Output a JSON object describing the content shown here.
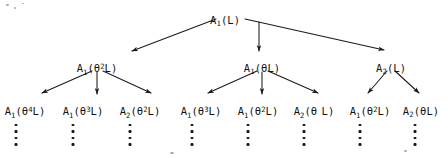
{
  "diagram": {
    "type": "tree",
    "title": "",
    "symbol_theta": "θ",
    "ink_color": "#121212",
    "background_color": "#ffffff",
    "levels": 3,
    "root": {
      "id": "root",
      "label": "A₁(L)",
      "base": "A",
      "subscript": "1",
      "open": "(",
      "operator": "",
      "exponent": "",
      "argument": "L",
      "close": ")",
      "x": 225,
      "y": 14
    },
    "level2": [
      {
        "id": "n2-1",
        "label": "A₁(θ²L)",
        "base": "A",
        "subscript": "1",
        "open": "(",
        "operator": "θ",
        "exponent": "2",
        "argument": "L",
        "close": ")",
        "x": 97,
        "y": 62
      },
      {
        "id": "n2-2",
        "label": "A₁(θL)",
        "base": "A",
        "subscript": "1",
        "open": "(",
        "operator": "θ",
        "exponent": "",
        "argument": "L",
        "close": ")",
        "x": 262,
        "y": 62
      },
      {
        "id": "n2-3",
        "label": "A₂(L)",
        "base": "A",
        "subscript": "2",
        "open": "(",
        "operator": "",
        "exponent": "",
        "argument": "L",
        "close": ")",
        "x": 391,
        "y": 62
      }
    ],
    "level3": [
      {
        "id": "n3-1",
        "label": "A₁(θ⁴L)",
        "base": "A",
        "subscript": "1",
        "open": "(",
        "operator": "θ",
        "exponent": "4",
        "argument": "L",
        "close": ")",
        "x": 25,
        "y": 105,
        "parent": "n2-1"
      },
      {
        "id": "n3-2",
        "label": "A₁(θ³L)",
        "base": "A",
        "subscript": "1",
        "open": "(",
        "operator": "θ",
        "exponent": "3",
        "argument": "L",
        "close": ")",
        "x": 83,
        "y": 105,
        "parent": "n2-1"
      },
      {
        "id": "n3-3",
        "label": "A₂(θ²L)",
        "base": "A",
        "subscript": "2",
        "open": "(",
        "operator": "θ",
        "exponent": "2",
        "argument": "L",
        "close": ")",
        "x": 140,
        "y": 105,
        "parent": "n2-1"
      },
      {
        "id": "n3-4",
        "label": "A₁(θ³L)",
        "base": "A",
        "subscript": "1",
        "open": "(",
        "operator": "θ",
        "exponent": "3",
        "argument": "L",
        "close": ")",
        "x": 201,
        "y": 105,
        "parent": "n2-2"
      },
      {
        "id": "n3-5",
        "label": "A₁(θ²L)",
        "base": "A",
        "subscript": "1",
        "open": "(",
        "operator": "θ",
        "exponent": "2",
        "argument": "L",
        "close": ")",
        "x": 258,
        "y": 105,
        "parent": "n2-2"
      },
      {
        "id": "n3-6",
        "label": "A₂(θ L)",
        "base": "A",
        "subscript": "2",
        "open": "(",
        "operator": "θ",
        "exponent": " ",
        "argument": "L",
        "close": ")",
        "x": 314,
        "y": 105,
        "parent": "n2-2"
      },
      {
        "id": "n3-7",
        "label": "A₁(θ²L)",
        "base": "A",
        "subscript": "1",
        "open": "(",
        "operator": "θ",
        "exponent": "2",
        "argument": "L",
        "close": ")",
        "x": 370,
        "y": 105,
        "parent": "n2-3"
      },
      {
        "id": "n3-8",
        "label": "A₂(θL)",
        "base": "A",
        "subscript": "2",
        "open": "(",
        "operator": "θ",
        "exponent": "",
        "argument": "L",
        "close": ")",
        "x": 421,
        "y": 105,
        "parent": "n2-3"
      }
    ],
    "ellipses": [
      {
        "id": "e1",
        "x": 16,
        "y": 124,
        "dots": 4
      },
      {
        "id": "e2",
        "x": 73,
        "y": 124,
        "dots": 4
      },
      {
        "id": "e3",
        "x": 130,
        "y": 124,
        "dots": 4
      },
      {
        "id": "e4",
        "x": 192,
        "y": 124,
        "dots": 4
      },
      {
        "id": "e5",
        "x": 248,
        "y": 124,
        "dots": 4
      },
      {
        "id": "e6",
        "x": 304,
        "y": 124,
        "dots": 4
      },
      {
        "id": "e7",
        "x": 360,
        "y": 124,
        "dots": 4
      },
      {
        "id": "e8",
        "x": 415,
        "y": 124,
        "dots": 4
      }
    ],
    "edges": [
      {
        "id": "edge-root-1",
        "from": "root",
        "to": "n2-1",
        "x1": 216,
        "y1": 19,
        "x2": 132,
        "y2": 51
      },
      {
        "id": "edge-root-2",
        "from": "root",
        "to": "n2-2",
        "x1": 259,
        "y1": 22,
        "x2": 259,
        "y2": 51
      },
      {
        "id": "edge-root-3",
        "from": "root",
        "to": "n2-3",
        "x1": 245,
        "y1": 19,
        "x2": 384,
        "y2": 50
      },
      {
        "id": "edge-n21-1",
        "from": "n2-1",
        "to": "n3-1",
        "x1": 92,
        "y1": 71,
        "x2": 42,
        "y2": 93
      },
      {
        "id": "edge-n21-2",
        "from": "n2-1",
        "to": "n3-2",
        "x1": 97,
        "y1": 72,
        "x2": 97,
        "y2": 94
      },
      {
        "id": "edge-n21-3",
        "from": "n2-1",
        "to": "n3-3",
        "x1": 103,
        "y1": 71,
        "x2": 151,
        "y2": 93
      },
      {
        "id": "edge-n22-1",
        "from": "n2-2",
        "to": "n3-4",
        "x1": 257,
        "y1": 71,
        "x2": 208,
        "y2": 93
      },
      {
        "id": "edge-n22-2",
        "from": "n2-2",
        "to": "n3-5",
        "x1": 262,
        "y1": 72,
        "x2": 262,
        "y2": 94
      },
      {
        "id": "edge-n22-3",
        "from": "n2-2",
        "to": "n3-6",
        "x1": 268,
        "y1": 71,
        "x2": 318,
        "y2": 93
      },
      {
        "id": "edge-n23-1",
        "from": "n2-3",
        "to": "n3-7",
        "x1": 387,
        "y1": 71,
        "x2": 368,
        "y2": 93
      },
      {
        "id": "edge-n23-2",
        "from": "n2-3",
        "to": "n3-8",
        "x1": 395,
        "y1": 71,
        "x2": 419,
        "y2": 93
      }
    ]
  }
}
